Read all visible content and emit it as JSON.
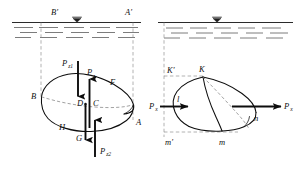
{
  "figure": {
    "accent_color": "#0d0d0d",
    "water_line_color": "#2b2b2b",
    "hatch_color": "#6d6d6d",
    "hidden_edge_color": "#7a7a7a",
    "water_symbol": "free-surface-triangle"
  },
  "left_panel": {
    "name": "vertical-force-diagram",
    "surface_labels": {
      "left": "B′",
      "right": "A′"
    },
    "body_labels": {
      "b": "B",
      "a": "A",
      "f": "F",
      "h": "H",
      "c": "C",
      "d": "D"
    },
    "forces": [
      {
        "id": "pz1",
        "label": "P",
        "sub": "z1",
        "direction": "down",
        "role": "upper-surface-pressure-force"
      },
      {
        "id": "pz",
        "label": "P",
        "sub": "z",
        "direction": "up",
        "role": "net-vertical-buoyant-force"
      },
      {
        "id": "g",
        "label": "G",
        "sub": "",
        "direction": "down",
        "role": "weight"
      },
      {
        "id": "pz2",
        "label": "P",
        "sub": "z2",
        "direction": "up",
        "role": "lower-surface-pressure-force"
      }
    ]
  },
  "right_panel": {
    "name": "horizontal-force-diagram",
    "body_labels": {
      "k_prime": "K′",
      "k": "K",
      "l": "l",
      "n": "n",
      "m_prime": "m′",
      "m": "m"
    },
    "forces": [
      {
        "id": "px_left",
        "label": "P",
        "sub": "x",
        "direction": "right",
        "role": "left-face-horizontal-pressure-force"
      },
      {
        "id": "px_right",
        "label": "P",
        "sub": "x",
        "direction": "right",
        "role": "right-face-horizontal-pressure-force"
      }
    ]
  }
}
